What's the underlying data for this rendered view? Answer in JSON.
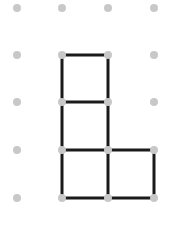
{
  "diagram": {
    "type": "dot-grid-matchstick",
    "grid": {
      "cols": 4,
      "rows": 5,
      "x": [
        17,
        62,
        108,
        154
      ],
      "y": [
        8,
        55,
        102,
        150,
        198
      ],
      "dot_color": "#c8c8c8",
      "dot_radius": 4
    },
    "segments": [
      {
        "from": [
          1,
          1
        ],
        "to": [
          2,
          1
        ]
      },
      {
        "from": [
          1,
          1
        ],
        "to": [
          1,
          2
        ]
      },
      {
        "from": [
          2,
          1
        ],
        "to": [
          2,
          2
        ]
      },
      {
        "from": [
          1,
          2
        ],
        "to": [
          2,
          2
        ]
      },
      {
        "from": [
          1,
          2
        ],
        "to": [
          1,
          3
        ]
      },
      {
        "from": [
          2,
          2
        ],
        "to": [
          2,
          3
        ]
      },
      {
        "from": [
          1,
          3
        ],
        "to": [
          2,
          3
        ]
      },
      {
        "from": [
          2,
          3
        ],
        "to": [
          3,
          3
        ]
      },
      {
        "from": [
          1,
          3
        ],
        "to": [
          1,
          4
        ]
      },
      {
        "from": [
          2,
          3
        ],
        "to": [
          2,
          4
        ]
      },
      {
        "from": [
          3,
          3
        ],
        "to": [
          3,
          4
        ]
      },
      {
        "from": [
          1,
          4
        ],
        "to": [
          2,
          4
        ]
      },
      {
        "from": [
          2,
          4
        ],
        "to": [
          3,
          4
        ]
      }
    ],
    "line_color": "#1a1a1a",
    "line_width": 3
  }
}
